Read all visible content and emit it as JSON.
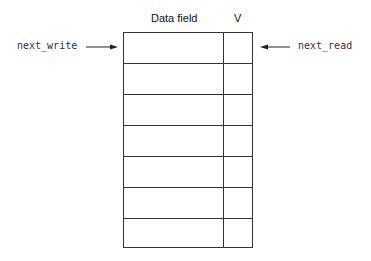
{
  "headers": {
    "data_field": "Data field",
    "valid": "V"
  },
  "labels": {
    "next_write": "next_write",
    "next_read": "next_read"
  },
  "rows": 7
}
